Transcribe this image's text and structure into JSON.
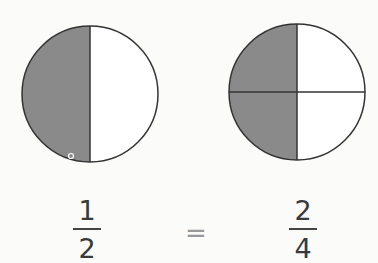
{
  "diagram": {
    "colors": {
      "shaded": "#8a8a8a",
      "unshaded": "#ffffff",
      "stroke": "#333333"
    },
    "left_circle": {
      "parts": 2,
      "shaded_parts": 1,
      "fraction": {
        "numerator": "1",
        "denominator": "2"
      }
    },
    "right_circle": {
      "parts": 4,
      "shaded_parts": 2,
      "fraction": {
        "numerator": "2",
        "denominator": "4"
      }
    },
    "equals_sign": "="
  }
}
